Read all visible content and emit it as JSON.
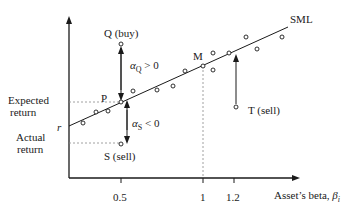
{
  "diagram": {
    "line_label": "SML",
    "y_axis": {
      "labels": {
        "expected_return": [
          "Expected",
          "return"
        ],
        "actual_return": [
          "Actual",
          "return"
        ],
        "risk_free": "r"
      }
    },
    "x_axis": {
      "label": "Asset’s beta, ",
      "label_symbol": "β",
      "label_symbol_sub": "i",
      "ticks": [
        "0.5",
        "1",
        "1.2"
      ]
    },
    "points": {
      "P": "P",
      "M": "M",
      "Q": "Q (buy)",
      "S": "S (sell)",
      "T": "T (sell)"
    },
    "annotations": {
      "alpha_Q": {
        "symbol": "α",
        "sub": "Q",
        "rel": " > 0"
      },
      "alpha_S": {
        "symbol": "α",
        "sub": "S",
        "rel": " < 0"
      }
    },
    "colors": {
      "ink": "#1a1a1a",
      "dashed": "#888888",
      "background": "#ffffff"
    }
  }
}
